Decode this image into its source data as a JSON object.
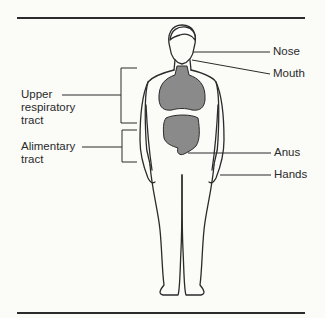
{
  "diagram": {
    "title": "",
    "labels": {
      "nose": "Nose",
      "mouth": "Mouth",
      "anus": "Anus",
      "hands": "Hands",
      "upper_respiratory": [
        "Upper",
        "respiratory",
        "tract"
      ],
      "alimentary": [
        "Alimentary",
        "tract"
      ]
    },
    "colors": {
      "line": "#2b2b2b",
      "organ_fill": "#8a8a8a",
      "background": "#fbfbf8"
    }
  }
}
